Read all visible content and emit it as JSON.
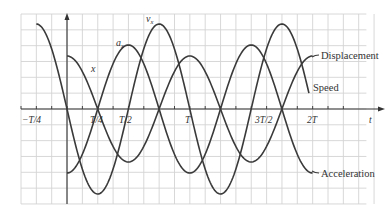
{
  "chart_data": {
    "type": "line",
    "title": "",
    "xlabel": "t",
    "ylabel": "",
    "x_ticks": [
      {
        "label": "−T/4",
        "value": -0.25
      },
      {
        "label": "T/4",
        "value": 0.25
      },
      {
        "label": "T/2",
        "value": 0.5
      },
      {
        "label": "T",
        "value": 1.0
      },
      {
        "label": "3T/2",
        "value": 1.5
      },
      {
        "label": "2T",
        "value": 2.0
      }
    ],
    "xlim": [
      -0.375,
      2.5
    ],
    "grid": true,
    "legend_position": "right, inline labels",
    "series": [
      {
        "name": "Displacement",
        "short_label": "x",
        "function": "A cos(2πt/T)",
        "relative_amplitude": 53,
        "t_range": [
          0,
          2.05
        ]
      },
      {
        "name": "Speed",
        "short_label": "v",
        "subscript": "x",
        "function": "−Aω sin(2πt/T)",
        "relative_amplitude": 85,
        "t_range": [
          -0.25,
          2.0
        ]
      },
      {
        "name": "Acceleration",
        "short_label": "a",
        "subscript": "x",
        "function": "−Aω² cos(2πt/T)",
        "relative_amplitude": 64,
        "t_range": [
          0,
          2.05
        ]
      }
    ]
  },
  "labels": {
    "x_axis": "t",
    "displacement": "Displacement",
    "speed": "Speed",
    "acceleration": "Acceleration",
    "x_curve": "x",
    "v_curve": "v",
    "v_sub": "x",
    "a_curve": "a",
    "a_sub": "x",
    "tick_neg_quarter": "−T/4",
    "tick_quarter": "T/4",
    "tick_half": "T/2",
    "tick_T": "T",
    "tick_three_half": "3T/2",
    "tick_2T": "2T"
  },
  "colors": {
    "curve": "#3a3a3a",
    "grid": "#d4d4d4",
    "axis": "#333333",
    "background": "#ffffff"
  }
}
